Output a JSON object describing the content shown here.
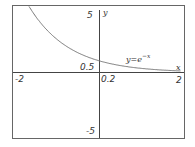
{
  "chart_data": {
    "type": "line",
    "title": "",
    "xlabel": "x",
    "ylabel": "y",
    "xlim": [
      -2,
      2
    ],
    "ylim": [
      -5,
      5
    ],
    "grid": false,
    "series": [
      {
        "name": "y=e^-x",
        "x": [
          -1.5,
          -1.0,
          -0.5,
          0,
          0.5,
          1.0,
          1.5,
          2.0
        ],
        "values": [
          4.48,
          2.72,
          1.65,
          1.0,
          0.61,
          0.37,
          0.22,
          0.14
        ]
      }
    ],
    "x_ticks": [
      "-2",
      "0.2",
      "2"
    ],
    "y_ticks": [
      "5",
      "0.5",
      "-5"
    ],
    "annotations": [
      {
        "text": "y=e^-x",
        "x": 1.0,
        "y": 1.0
      }
    ]
  },
  "labels": {
    "x_min": "-2",
    "x_max": "2",
    "x_small": "0.2",
    "y_max": "5",
    "y_min": "-5",
    "y_small": "0.5",
    "x_axis": "x",
    "y_axis": "y",
    "curve_y": "y=e",
    "curve_exp": "−x"
  },
  "colors": {
    "frame": "#555555",
    "axes": "#444444",
    "curve": "#777777"
  }
}
